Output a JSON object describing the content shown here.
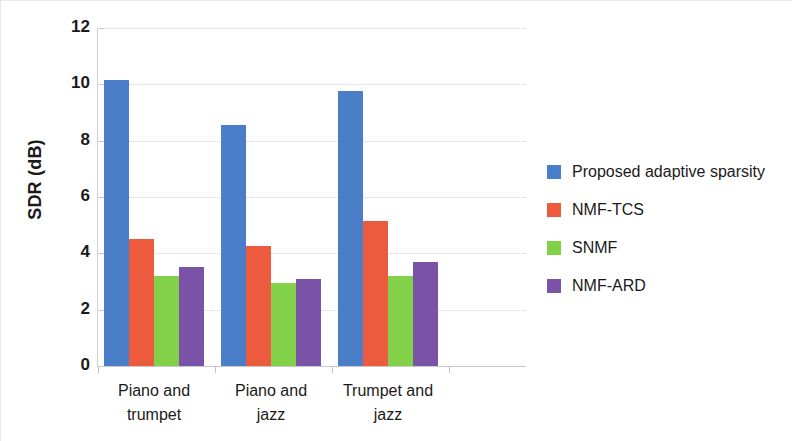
{
  "chart_data": {
    "type": "bar",
    "title": "",
    "xlabel": "",
    "ylabel": "SDR (dB)",
    "categories": [
      "Piano and trumpet",
      "Piano and jazz",
      "Trumpet and jazz"
    ],
    "category_lines": [
      [
        "Piano and",
        "trumpet"
      ],
      [
        "Piano and",
        "jazz"
      ],
      [
        "Trumpet and",
        "jazz"
      ]
    ],
    "series": [
      {
        "name": "Proposed adaptive sparsity",
        "color": "#4a7ec8",
        "values": [
          10.15,
          8.55,
          9.75
        ]
      },
      {
        "name": "NMF-TCS",
        "color": "#ec5b3e",
        "values": [
          4.5,
          4.25,
          5.15
        ]
      },
      {
        "name": "SNMF",
        "color": "#82d148",
        "values": [
          3.2,
          2.95,
          3.2
        ]
      },
      {
        "name": "NMF-ARD",
        "color": "#7a52a8",
        "values": [
          3.5,
          3.1,
          3.7
        ]
      }
    ],
    "ylim": [
      0,
      12
    ],
    "yticks": [
      0,
      2,
      4,
      6,
      8,
      10,
      12
    ],
    "ytick_labels": [
      "0",
      "2",
      "4",
      "6",
      "8",
      "10",
      "12"
    ],
    "grid": true,
    "legend_position": "right"
  }
}
